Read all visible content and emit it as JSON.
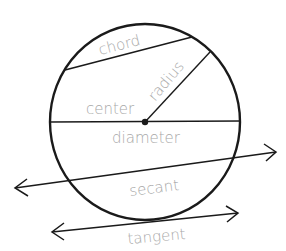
{
  "diagram": {
    "colors": {
      "stroke": "#1a1a1a",
      "label": "#a8a8a8",
      "background": "#ffffff"
    },
    "labels": {
      "chord": "chord",
      "radius": "radius",
      "center": "center",
      "diameter": "diameter",
      "secant": "secant",
      "tangent": "tangent"
    }
  }
}
